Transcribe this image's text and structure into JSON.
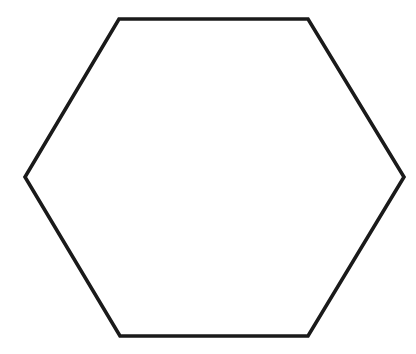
{
  "canvas": {
    "width": 416,
    "height": 354,
    "background_color": "#ffffff",
    "title": "Hexagon"
  },
  "diagram": {
    "type": "polygon",
    "shape_name": "hexagon",
    "sides": 6,
    "orientation": "flat-top",
    "label": "",
    "fill_color": "#ffffff",
    "stroke_color": "#1a1a1a",
    "stroke_width": 3.6,
    "vertices": [
      {
        "name": "top-left",
        "x": 119,
        "y": 19
      },
      {
        "name": "top-right",
        "x": 308,
        "y": 19
      },
      {
        "name": "right",
        "x": 404,
        "y": 177
      },
      {
        "name": "bottom-right",
        "x": 308,
        "y": 336
      },
      {
        "name": "bottom-left",
        "x": 120,
        "y": 336
      },
      {
        "name": "left",
        "x": 25,
        "y": 177
      }
    ],
    "points_attr": "119,19 308,19 404,177 308,336 120,336 25,177"
  }
}
